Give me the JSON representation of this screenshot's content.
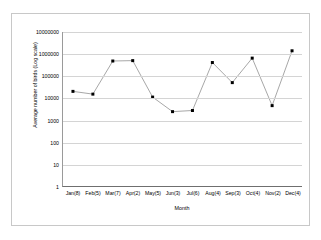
{
  "chart_data": {
    "type": "line",
    "title": "",
    "xlabel": "Month",
    "ylabel": "Average number of birds (Log scale)",
    "categories": [
      "Jan(8)",
      "Feb(5)",
      "Mar(7)",
      "Apr(2)",
      "May(5)",
      "Jun(3)",
      "Jul(6)",
      "Aug(4)",
      "Sep(3)",
      "Oct(4)",
      "Nov(2)",
      "Dec(4)"
    ],
    "values": [
      20000,
      15000,
      480000,
      500000,
      11000,
      2400,
      2700,
      410000,
      50000,
      650000,
      4500,
      1400000
    ],
    "yscale": "log",
    "ylim": [
      1,
      10000000
    ],
    "yticks": [
      1,
      10,
      100,
      1000,
      10000,
      100000,
      1000000,
      10000000
    ],
    "ytick_labels": [
      "1",
      "10",
      "100",
      "1000",
      "10000",
      "100000",
      "1000000",
      "10000000"
    ],
    "grid": true,
    "legend": false,
    "marker": "square",
    "line_color": "#808080",
    "marker_color": "#000000"
  }
}
